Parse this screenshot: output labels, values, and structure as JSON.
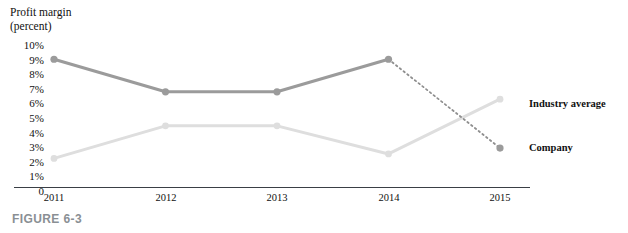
{
  "figure": {
    "caption": "FIGURE 6-3"
  },
  "chart_data": {
    "type": "line",
    "title": "Profit margin (percent)",
    "title_lines": [
      "Profit margin",
      "(percent)"
    ],
    "xlabel": "",
    "ylabel": "Profit margin (percent)",
    "categories": [
      "2011",
      "2012",
      "2013",
      "2014",
      "2015"
    ],
    "x_tick_labels": [
      "2011",
      "2012",
      "2013",
      "2014",
      "2015"
    ],
    "y_tick_labels": [
      "10%",
      "9%",
      "8%",
      "7%",
      "6%",
      "5%",
      "4%",
      "3%",
      "2%",
      "1%",
      "0"
    ],
    "y_tick_values": [
      10,
      9,
      8,
      7,
      6,
      5,
      4,
      3,
      2,
      1,
      0
    ],
    "ylim": [
      0,
      10
    ],
    "grid": false,
    "legend_position": "right",
    "series": [
      {
        "name": "Company",
        "color": "#9b9b9b",
        "values": [
          8.7,
          6.5,
          6.5,
          8.7,
          2.7
        ],
        "dashed_from_index": 3,
        "dashed_note": "2014 to 2015 segment is dotted"
      },
      {
        "name": "Industry average",
        "color": "#dedede",
        "values": [
          2.0,
          4.2,
          4.2,
          2.3,
          6.0
        ],
        "dashed_from_index": -1,
        "dashed_note": ""
      }
    ]
  },
  "legend": {
    "items": [
      {
        "label": "Industry average",
        "color": "#dedede",
        "value_at_2015": 6.0
      },
      {
        "label": "Company",
        "color": "#9b9b9b",
        "value_at_2015": 2.7
      }
    ]
  },
  "colors": {
    "company_line": "#9b9b9b",
    "industry_line": "#dedede",
    "axis": "#3a3f45",
    "caption": "#8a8f94",
    "text": "#111111"
  }
}
